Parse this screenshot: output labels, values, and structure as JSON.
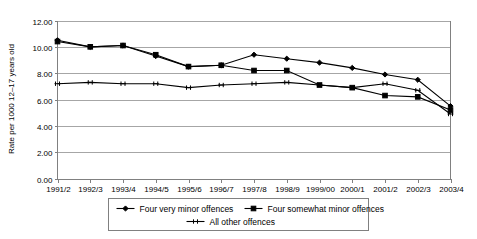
{
  "chart_data": {
    "type": "line",
    "title": "",
    "xlabel": "",
    "ylabel": "Rate per 1000 12–17 years old",
    "ylim": [
      0.0,
      12.0
    ],
    "ytick_step": 2.0,
    "grid": true,
    "legend_position": "bottom",
    "categories": [
      "1991/2",
      "1992/3",
      "1993/4",
      "1994/5",
      "1995/6",
      "1996/7",
      "1997/8",
      "1998/9",
      "1999/00",
      "2000/1",
      "2001/2",
      "2002/3",
      "2003/4"
    ],
    "ytick_labels": [
      "0.00",
      "2.00",
      "4.00",
      "6.00",
      "8.00",
      "10.00",
      "12.00"
    ],
    "ytick_values": [
      0.0,
      2.0,
      4.0,
      6.0,
      8.0,
      10.0,
      12.0
    ],
    "series": [
      {
        "name": "Four very minor offences",
        "marker": "diamond",
        "values": [
          10.5,
          10.0,
          10.1,
          9.3,
          8.5,
          8.6,
          9.4,
          9.1,
          8.8,
          8.4,
          7.9,
          7.5,
          5.5
        ]
      },
      {
        "name": "Four somewhat minor offences",
        "marker": "square",
        "values": [
          10.4,
          10.0,
          10.1,
          9.4,
          8.5,
          8.6,
          8.2,
          8.2,
          7.1,
          6.9,
          6.3,
          6.2,
          5.2
        ]
      },
      {
        "name": "All other offences",
        "marker": "cross",
        "values": [
          7.2,
          7.3,
          7.2,
          7.2,
          6.9,
          7.1,
          7.2,
          7.3,
          7.1,
          6.9,
          7.2,
          6.7,
          4.9
        ]
      }
    ]
  },
  "legend": {
    "items": [
      {
        "label": "Four very minor offences",
        "marker": "diamond"
      },
      {
        "label": "Four somewhat minor offences",
        "marker": "square"
      },
      {
        "label": "All other offences",
        "marker": "cross"
      }
    ]
  }
}
